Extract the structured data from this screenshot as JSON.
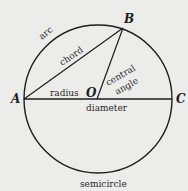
{
  "diagram": {
    "colors": {
      "background": "#ececea",
      "stroke": "#1e1e1e"
    },
    "points": {
      "A": "A",
      "B": "B",
      "C": "C",
      "O": "O"
    },
    "labels": {
      "arc": "arc",
      "chord": "chord",
      "radius": "radius",
      "central_line1": "central",
      "central_line2": "angle",
      "diameter": "diameter",
      "semicircle": "semicircle"
    }
  }
}
